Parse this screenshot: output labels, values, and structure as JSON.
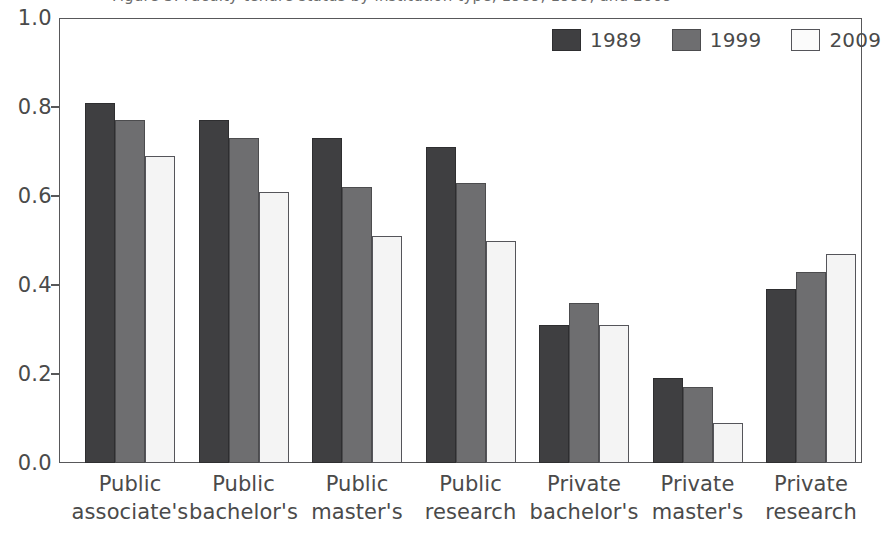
{
  "caption": {
    "text": "Figure 3. Faculty tenure status by institution type, 1989, 1999, and 2009",
    "visibility": "clipped-at-top-edge"
  },
  "chart_data": {
    "type": "bar",
    "title": "",
    "xlabel": "",
    "ylabel": "",
    "ylim": [
      0.0,
      1.0
    ],
    "grid": false,
    "legend_position": "top-right-inside",
    "categories": [
      "Public associate's",
      "Public bachelor's",
      "Public master's",
      "Public research",
      "Private bachelor's",
      "Private master's",
      "Private research"
    ],
    "category_lines": [
      [
        "Public",
        "associate's"
      ],
      [
        "Public",
        "bachelor's"
      ],
      [
        "Public",
        "master's"
      ],
      [
        "Public",
        "research"
      ],
      [
        "Private",
        "bachelor's"
      ],
      [
        "Private",
        "master's"
      ],
      [
        "Private",
        "research"
      ]
    ],
    "ytick_labels": [
      "1.0",
      "0.8",
      "0.6",
      "0.4",
      "0.2",
      "0.0"
    ],
    "ytick_values": [
      1.0,
      0.8,
      0.6,
      0.4,
      0.2,
      0.0
    ],
    "series": [
      {
        "name": "1989",
        "color": "#3f3f41",
        "values": [
          0.81,
          0.77,
          0.73,
          0.71,
          0.31,
          0.19,
          0.39
        ]
      },
      {
        "name": "1999",
        "color": "#6e6e70",
        "values": [
          0.77,
          0.73,
          0.62,
          0.63,
          0.36,
          0.17,
          0.43
        ]
      },
      {
        "name": "2009",
        "color": "#f4f4f4",
        "values": [
          0.69,
          0.61,
          0.51,
          0.5,
          0.31,
          0.09,
          0.47
        ]
      }
    ]
  },
  "legend": {
    "items": [
      {
        "label": "1989",
        "swatch": "s1989"
      },
      {
        "label": "1999",
        "swatch": "s1999"
      },
      {
        "label": "2009",
        "swatch": "s2009"
      }
    ]
  },
  "colors": {
    "series_1989": "#3f3f41",
    "series_1999": "#6e6e70",
    "series_2009": "#f4f4f4",
    "axis": "#58585a",
    "text": "#4a4a4a",
    "background": "#ffffff"
  }
}
